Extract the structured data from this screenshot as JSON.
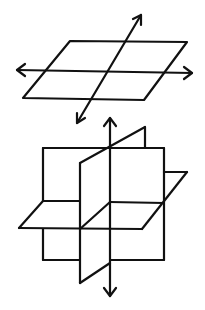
{
  "figure": {
    "stroke_color": "#111111",
    "background": "#ffffff"
  },
  "top_diagram": {
    "label": "plane-with-two-lines",
    "plane": [
      [
        70,
        41
      ],
      [
        187,
        42
      ],
      [
        144,
        100
      ],
      [
        23,
        98
      ]
    ],
    "horizontal_line": {
      "from": [
        192,
        73
      ],
      "to": [
        17,
        70
      ]
    },
    "diagonal_line": {
      "from": [
        77,
        123
      ],
      "to": [
        141,
        15
      ]
    }
  },
  "bottom_diagram": {
    "label": "three-intersecting-planes",
    "vertical_axis": {
      "from": [
        110,
        296
      ],
      "to": [
        110,
        118
      ]
    },
    "front_square": [
      [
        43,
        148
      ],
      [
        164,
        148
      ],
      [
        164,
        260
      ],
      [
        43,
        260
      ]
    ]
  }
}
